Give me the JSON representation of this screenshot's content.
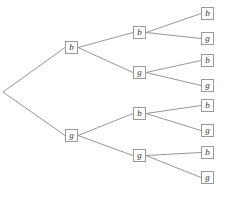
{
  "figure": {
    "kind": "binary-probability-tree",
    "background_color": "#ffffff",
    "edge_color": "#8a8a8a",
    "node_border_color": "#9a9a9a",
    "node_fill_color": "#ffffff",
    "label_color": "#3a3a3a",
    "width": 226,
    "height": 197
  },
  "root": {
    "x": 3,
    "y": 92,
    "has_box": false
  },
  "nodes": [
    {
      "id": "n1",
      "label": "b",
      "level": 1,
      "x": 71.5,
      "y": 47.5,
      "cx": 71.5,
      "cy": 47.5
    },
    {
      "id": "n2",
      "label": "g",
      "level": 1,
      "x": 71.5,
      "y": 135.5,
      "cx": 71.5,
      "cy": 135.5
    },
    {
      "id": "n11",
      "label": "b",
      "level": 2,
      "x": 139.5,
      "y": 32.5,
      "cx": 139.5,
      "cy": 32.5
    },
    {
      "id": "n12",
      "label": "g",
      "level": 2,
      "x": 139.5,
      "y": 72.5,
      "cx": 139.5,
      "cy": 72.5
    },
    {
      "id": "n21",
      "label": "b",
      "level": 2,
      "x": 139.5,
      "y": 113.5,
      "cx": 139.5,
      "cy": 113.5
    },
    {
      "id": "n22",
      "label": "g",
      "level": 2,
      "x": 139.5,
      "y": 155.5,
      "cx": 139.5,
      "cy": 155.5
    },
    {
      "id": "n111",
      "label": "b",
      "level": 3,
      "x": 207.5,
      "y": 13.5,
      "cx": 207.5,
      "cy": 13.5
    },
    {
      "id": "n112",
      "label": "g",
      "level": 3,
      "x": 207.5,
      "y": 38.5,
      "cx": 207.5,
      "cy": 38.5
    },
    {
      "id": "n121",
      "label": "b",
      "level": 3,
      "x": 207.5,
      "y": 60.5,
      "cx": 207.5,
      "cy": 60.5
    },
    {
      "id": "n122",
      "label": "g",
      "level": 3,
      "x": 207.5,
      "y": 85.5,
      "cx": 207.5,
      "cy": 85.5
    },
    {
      "id": "n211",
      "label": "b",
      "level": 3,
      "x": 207.5,
      "y": 105.5,
      "cx": 207.5,
      "cy": 105.5
    },
    {
      "id": "n212",
      "label": "g",
      "level": 3,
      "x": 207.5,
      "y": 130.5,
      "cx": 207.5,
      "cy": 130.5
    },
    {
      "id": "n221",
      "label": "b",
      "level": 3,
      "x": 207.5,
      "y": 152.5,
      "cx": 207.5,
      "cy": 152.5
    },
    {
      "id": "n222",
      "label": "g",
      "level": 3,
      "x": 207.5,
      "y": 177.5,
      "cx": 207.5,
      "cy": 177.5
    }
  ],
  "edges": [
    {
      "id": "e-root-n1",
      "x1": 3,
      "y1": 92,
      "x2": 65,
      "y2": 47.5
    },
    {
      "id": "e-root-n2",
      "x1": 3,
      "y1": 92,
      "x2": 65,
      "y2": 135.5
    },
    {
      "id": "e-n1-n11",
      "x1": 78,
      "y1": 47.5,
      "x2": 133,
      "y2": 32.5
    },
    {
      "id": "e-n1-n12",
      "x1": 78,
      "y1": 47.5,
      "x2": 133,
      "y2": 72.5
    },
    {
      "id": "e-n2-n21",
      "x1": 78,
      "y1": 135.5,
      "x2": 133,
      "y2": 113.5
    },
    {
      "id": "e-n2-n22",
      "x1": 78,
      "y1": 135.5,
      "x2": 133,
      "y2": 155.5
    },
    {
      "id": "e-n11-n111",
      "x1": 146,
      "y1": 32.5,
      "x2": 201,
      "y2": 13.5
    },
    {
      "id": "e-n11-n112",
      "x1": 146,
      "y1": 32.5,
      "x2": 201,
      "y2": 38.5
    },
    {
      "id": "e-n12-n121",
      "x1": 146,
      "y1": 72.5,
      "x2": 201,
      "y2": 60.5
    },
    {
      "id": "e-n12-n122",
      "x1": 146,
      "y1": 72.5,
      "x2": 201,
      "y2": 85.5
    },
    {
      "id": "e-n21-n211",
      "x1": 146,
      "y1": 113.5,
      "x2": 201,
      "y2": 105.5
    },
    {
      "id": "e-n21-n212",
      "x1": 146,
      "y1": 113.5,
      "x2": 201,
      "y2": 130.5
    },
    {
      "id": "e-n22-n221",
      "x1": 146,
      "y1": 155.5,
      "x2": 201,
      "y2": 152.5
    },
    {
      "id": "e-n22-n222",
      "x1": 146,
      "y1": 155.5,
      "x2": 201,
      "y2": 177.5
    }
  ]
}
